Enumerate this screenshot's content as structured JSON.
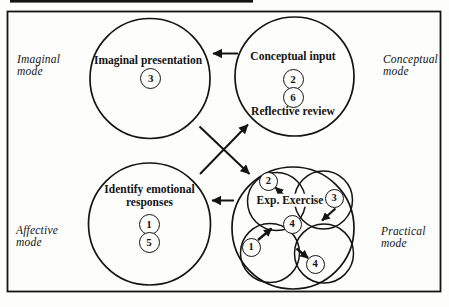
{
  "figure": {
    "mode_labels": {
      "imaginal": "Imaginal\nmode",
      "conceptual": "Conceptual\nmode",
      "affective": "Affective\nmode",
      "practical": "Practical\nmode"
    },
    "circles": {
      "imaginal": {
        "title": "Imaginal presentation",
        "steps": [
          "3"
        ]
      },
      "conceptual": {
        "title": "Conceptual input",
        "footer": "Reflective review",
        "steps": [
          "2",
          "6"
        ]
      },
      "affective": {
        "title": "Identify emotional\nresponses",
        "steps": [
          "1",
          "5"
        ]
      },
      "practical": {
        "title": "Exp. Exercise",
        "steps": [
          "2",
          "3",
          "4",
          "1",
          "4"
        ]
      }
    }
  }
}
